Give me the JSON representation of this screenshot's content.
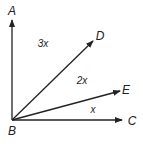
{
  "diagram": {
    "type": "angle-diagram",
    "vertex": {
      "label": "B",
      "x": 12,
      "y": 120,
      "label_x": 12,
      "label_y": 135
    },
    "rays": [
      {
        "name": "BA",
        "end_label": "A",
        "tip_x": 12,
        "tip_y": 20,
        "label_x": 12,
        "label_y": 15
      },
      {
        "name": "BD",
        "end_label": "D",
        "tip_x": 93,
        "tip_y": 41,
        "label_x": 100,
        "label_y": 40
      },
      {
        "name": "BE",
        "end_label": "E",
        "tip_x": 120,
        "tip_y": 91,
        "label_x": 126,
        "label_y": 94
      },
      {
        "name": "BC",
        "end_label": "C",
        "tip_x": 122,
        "tip_y": 120,
        "label_x": 132,
        "label_y": 125
      }
    ],
    "angle_labels": [
      {
        "between": "ABD",
        "text": "3x",
        "x": 43,
        "y": 47
      },
      {
        "between": "DBE",
        "text": "2x",
        "x": 82,
        "y": 84
      },
      {
        "between": "EBC",
        "text": "x",
        "x": 93,
        "y": 113
      }
    ],
    "colors": {
      "line": "#222222",
      "text": "#222222",
      "background": "#ffffff"
    }
  }
}
